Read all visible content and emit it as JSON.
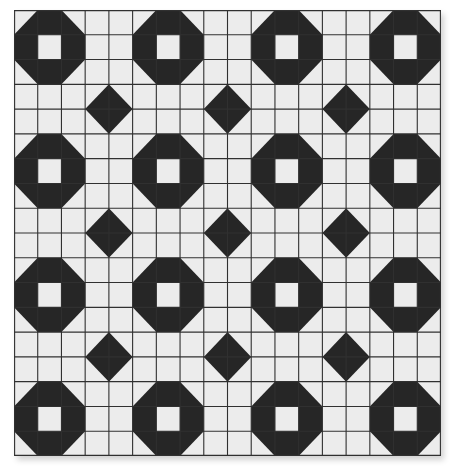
{
  "title": "Octagon and diamond quilt block pattern",
  "grid": {
    "columns": 18,
    "rows": 18,
    "width_px": 427,
    "height_px": 446,
    "line_color": "#303030",
    "background_color": "#ececec",
    "fill_color": "#262626"
  },
  "octagons": {
    "size_cells": 3,
    "hollow_center": true,
    "origins": [
      [
        0,
        0
      ],
      [
        5,
        0
      ],
      [
        10,
        0
      ],
      [
        15,
        0
      ],
      [
        0,
        5
      ],
      [
        5,
        5
      ],
      [
        10,
        5
      ],
      [
        15,
        5
      ],
      [
        0,
        10
      ],
      [
        5,
        10
      ],
      [
        10,
        10
      ],
      [
        15,
        10
      ],
      [
        0,
        15
      ],
      [
        5,
        15
      ],
      [
        10,
        15
      ],
      [
        15,
        15
      ]
    ]
  },
  "diamonds": {
    "size_cells": 2,
    "origins": [
      [
        3,
        3
      ],
      [
        8,
        3
      ],
      [
        13,
        3
      ],
      [
        3,
        8
      ],
      [
        8,
        8
      ],
      [
        13,
        8
      ],
      [
        3,
        13
      ],
      [
        8,
        13
      ],
      [
        13,
        13
      ]
    ]
  }
}
